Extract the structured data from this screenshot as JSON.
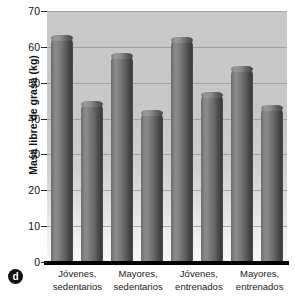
{
  "panel": {
    "letter": "d"
  },
  "chart_data": {
    "type": "bar",
    "title": "",
    "xlabel": "",
    "ylabel": "Masa libre de grasa (kg)",
    "ylim": [
      0,
      70
    ],
    "ytick_step": 10,
    "yticks": [
      0,
      10,
      20,
      30,
      40,
      50,
      60,
      70
    ],
    "ytick_labels": [
      "0",
      "10",
      "20",
      "30",
      "40",
      "50",
      "60",
      "70"
    ],
    "grid": true,
    "grid_axis": "y",
    "legend": false,
    "legend_position": "none",
    "categories": [
      "Jóvenes, sedentarios",
      "Mayores, sedentarios",
      "Jóvenes, entrenados",
      "Mayores, entrenados"
    ],
    "category_lines": [
      [
        "Jóvenes,",
        "sedentarios"
      ],
      [
        "Mayores,",
        "sedentarios"
      ],
      [
        "Jóvenes,",
        "entrenados"
      ],
      [
        "Mayores,",
        "entrenados"
      ]
    ],
    "series": [
      {
        "name": "Hombres",
        "values": [
          63.0,
          58.0,
          62.5,
          54.5
        ]
      },
      {
        "name": "Mujeres",
        "values": [
          44.5,
          42.0,
          47.0,
          43.5
        ]
      }
    ],
    "bars": [
      {
        "category": "Jóvenes, sedentarios",
        "series": "Hombres",
        "value": 63.0
      },
      {
        "category": "Jóvenes, sedentarios",
        "series": "Mujeres",
        "value": 44.5
      },
      {
        "category": "Mayores, sedentarios",
        "series": "Hombres",
        "value": 58.0
      },
      {
        "category": "Mayores, sedentarios",
        "series": "Mujeres",
        "value": 42.0
      },
      {
        "category": "Jóvenes, entrenados",
        "series": "Hombres",
        "value": 62.5
      },
      {
        "category": "Jóvenes, entrenados",
        "series": "Mujeres",
        "value": 47.0
      },
      {
        "category": "Mayores, entrenados",
        "series": "Hombres",
        "value": 54.5
      },
      {
        "category": "Mayores, entrenados",
        "series": "Mujeres",
        "value": 43.5
      }
    ],
    "colors": {
      "bar_dark": "#3c3c3c",
      "bar_mid": "#6a6a6a",
      "bar_light": "#9a9a9a",
      "plot_background": "#c9c9c9",
      "plot_background_bottom": "#f7f7f7",
      "gridline": "#9a9a9a",
      "axis": "#000000",
      "text": "#111111"
    }
  }
}
